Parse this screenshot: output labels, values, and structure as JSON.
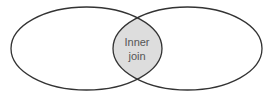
{
  "diagram": {
    "type": "venn",
    "left_set": {
      "label": ""
    },
    "right_set": {
      "label": ""
    },
    "intersection": {
      "line1": "Inner",
      "line2": "join",
      "fill": "#dddddd"
    },
    "stroke": "#333333"
  }
}
